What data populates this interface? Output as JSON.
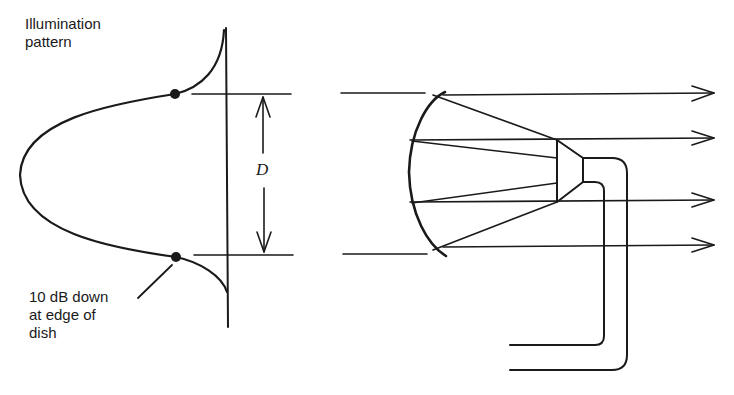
{
  "diagram": {
    "labels": {
      "illumination_line1": "Illumination",
      "illumination_line2": "pattern",
      "edge_line1": "10 dB down",
      "edge_line2": "at edge of",
      "edge_line3": "dish",
      "diameter": "D"
    },
    "colors": {
      "stroke": "#1a1a1a",
      "background": "#ffffff"
    },
    "components": {
      "left": "illumination-pattern-plot",
      "right": "parabolic-dish-with-feed-horn"
    }
  }
}
